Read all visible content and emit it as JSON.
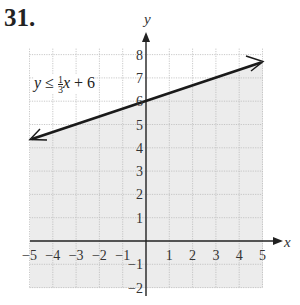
{
  "problem_number": "31.",
  "inequality": {
    "lhs": "y",
    "op": "≤",
    "num": "1",
    "den": "3",
    "var": "x",
    "rest": "+ 6"
  },
  "chart_data": {
    "type": "line",
    "title": "",
    "xlabel": "x",
    "ylabel": "y",
    "xlim": [
      -5,
      5
    ],
    "ylim": [
      -2,
      8
    ],
    "grid": true,
    "x_ticks": [
      "-5",
      "-4",
      "-3",
      "-2",
      "-1",
      "1",
      "2",
      "3",
      "4",
      "5"
    ],
    "y_ticks": [
      "-2",
      "-1",
      "1",
      "2",
      "3",
      "4",
      "5",
      "6",
      "7",
      "8"
    ],
    "series": [
      {
        "name": "y = (1/3)x + 6",
        "x": [
          -5,
          5
        ],
        "y": [
          4.33,
          7.67
        ],
        "style": "solid boundary with arrows"
      }
    ],
    "shaded_region": "below the line (y ≤ (1/3)x + 6)",
    "annotations": [
      "y ≤ (1/3)x + 6"
    ]
  }
}
